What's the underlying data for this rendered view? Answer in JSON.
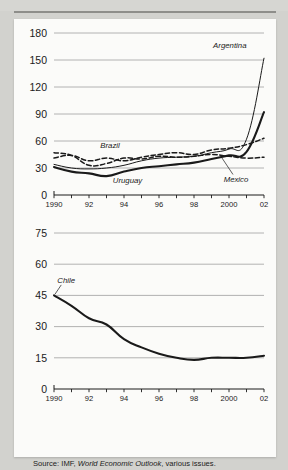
{
  "page": {
    "ghost_caption": "",
    "source_note": {
      "prefix": "Source: IMF, ",
      "italic": "World Economic Outlook",
      "suffix": ", various issues."
    }
  },
  "chart_data": [
    {
      "id": "chart-top",
      "type": "line",
      "title": "",
      "xlabel": "",
      "ylabel": "",
      "xlim": [
        1990,
        2002
      ],
      "ylim": [
        0,
        180
      ],
      "yticks": [
        0,
        30,
        60,
        90,
        120,
        150,
        180
      ],
      "xticks": [
        1990,
        1991,
        1992,
        1993,
        1994,
        1995,
        1996,
        1997,
        1998,
        1999,
        2000,
        2001,
        2002
      ],
      "xticklabels": [
        "1990",
        "",
        "92",
        "",
        "94",
        "",
        "96",
        "",
        "98",
        "",
        "2000",
        "",
        "02"
      ],
      "grid": "horizontal",
      "legend": "inline-labels",
      "x": [
        1990,
        1991,
        1992,
        1993,
        1994,
        1995,
        1996,
        1997,
        1998,
        1999,
        2000,
        2001,
        2002
      ],
      "series": [
        {
          "name": "Argentina",
          "style": "solid-thin",
          "color": "#1a1a1a",
          "label_x": 2001.0,
          "label_y": 163,
          "values": [
            34,
            30,
            29,
            30,
            33,
            38,
            41,
            42,
            43,
            47,
            51,
            62,
            152
          ]
        },
        {
          "name": "Brazil",
          "style": "dashed",
          "color": "#1a1a1a",
          "label_x": 1993.2,
          "label_y": 52,
          "values": [
            41,
            44,
            38,
            41,
            38,
            42,
            45,
            47,
            45,
            50,
            52,
            56,
            63
          ]
        },
        {
          "name": "Uruguay",
          "style": "solid-thick",
          "color": "#1a1a1a",
          "label_x": 1994.2,
          "label_y": 13,
          "values": [
            31,
            26,
            24,
            21,
            26,
            30,
            32,
            34,
            36,
            40,
            44,
            48,
            92
          ]
        },
        {
          "name": "Mexico",
          "style": "dashed",
          "color": "#1a1a1a",
          "label_x": 2000.4,
          "label_y": 15,
          "values": [
            47,
            44,
            33,
            35,
            41,
            40,
            43,
            42,
            43,
            45,
            43,
            41,
            42
          ]
        }
      ]
    },
    {
      "id": "chart-bottom",
      "type": "line",
      "title": "",
      "xlabel": "",
      "ylabel": "",
      "xlim": [
        1990,
        2002
      ],
      "ylim": [
        0,
        75
      ],
      "yticks": [
        0,
        15,
        30,
        45,
        60,
        75
      ],
      "xticks": [
        1990,
        1991,
        1992,
        1993,
        1994,
        1995,
        1996,
        1997,
        1998,
        1999,
        2000,
        2001,
        2002
      ],
      "xticklabels": [
        "1990",
        "",
        "92",
        "",
        "94",
        "",
        "96",
        "",
        "98",
        "",
        "2000",
        "",
        "02"
      ],
      "grid": "horizontal",
      "legend": "inline-labels",
      "x": [
        1990,
        1991,
        1992,
        1993,
        1994,
        1995,
        1996,
        1997,
        1998,
        1999,
        2000,
        2001,
        2002
      ],
      "series": [
        {
          "name": "Chile",
          "style": "solid-thick",
          "color": "#1a1a1a",
          "label_x": 1990.7,
          "label_y": 51,
          "values": [
            45,
            40,
            34,
            31,
            24,
            20,
            17,
            15,
            14,
            15,
            15,
            15,
            16
          ]
        }
      ]
    }
  ]
}
